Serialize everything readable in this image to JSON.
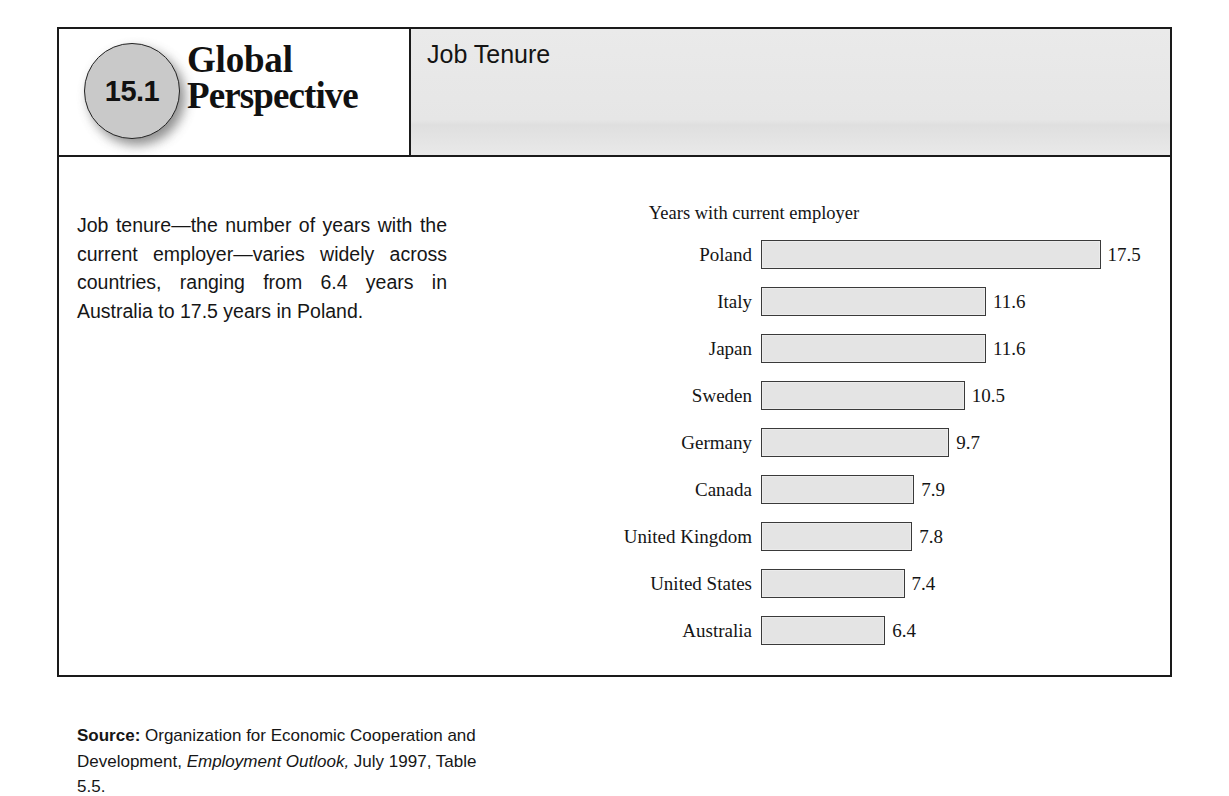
{
  "badge": {
    "number": "15.1"
  },
  "brand": {
    "line1": "Global",
    "line2": "Perspective"
  },
  "panel": {
    "title": "Job Tenure"
  },
  "intro": {
    "text": "Job tenure—the number of years with the current employer—varies widely across countries, ranging from 6.4 years in Australia to 17.5 years in Poland."
  },
  "source": {
    "label": "Source:",
    "part1": " Organization for Economic Cooperation and Development, ",
    "italic": "Employment Outlook,",
    "part2": " July 1997, Table 5.5."
  },
  "chart_data": {
    "type": "bar",
    "orientation": "horizontal",
    "title": "Years with current employer",
    "xlabel": "",
    "ylabel": "",
    "xlim": [
      0,
      17.5
    ],
    "grid": false,
    "legend": null,
    "categories": [
      "Poland",
      "Italy",
      "Japan",
      "Sweden",
      "Germany",
      "Canada",
      "United Kingdom",
      "United States",
      "Australia"
    ],
    "values": [
      17.5,
      11.6,
      11.6,
      10.5,
      9.7,
      7.9,
      7.8,
      7.4,
      6.4
    ],
    "value_labels": [
      "17.5",
      "11.6",
      "11.6",
      "10.5",
      "9.7",
      "7.9",
      "7.8",
      "7.4",
      "6.4"
    ],
    "bar_fill": "#e4e4e4",
    "bar_border": "#3a3a3a",
    "px_per_unit": 19.4
  },
  "colors": {
    "frame_border": "#1a1a1a",
    "header_panel_bg": "#e8e8e8",
    "badge_fill": "#c9c9c9",
    "text": "#141414"
  }
}
